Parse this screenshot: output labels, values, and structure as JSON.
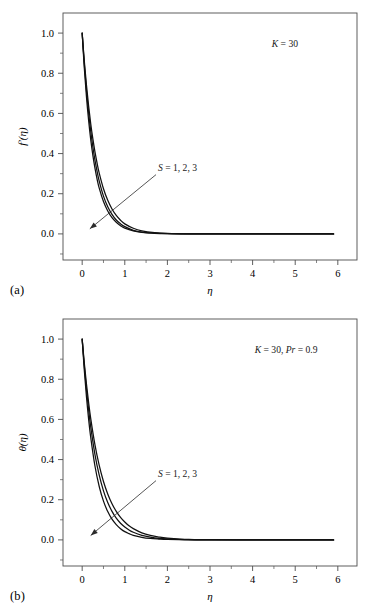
{
  "figure": {
    "background": "#ffffff",
    "curve_color": "#111111",
    "axis_color": "#4d4d4d"
  },
  "panels": [
    {
      "id": "a",
      "label": "(a)",
      "annotation": "K = 30",
      "annotation_parts": {
        "symbol": "K",
        "rest": " = 30"
      },
      "curve_label": "S = 1, 2, 3",
      "curve_label_parts": {
        "symbol": "S",
        "rest": " = 1, 2, 3"
      },
      "chart_data": {
        "type": "line",
        "title": "",
        "xlabel": "η",
        "ylabel": "f′(η)",
        "xlim": [
          -0.45,
          6.45
        ],
        "ylim": [
          -0.13,
          1.1
        ],
        "xticks": [
          0,
          1,
          2,
          3,
          4,
          5,
          6
        ],
        "xticklabels": [
          "0",
          "1",
          "2",
          "3",
          "4",
          "5",
          "6"
        ],
        "xminor_step": 0.5,
        "yticks": [
          0.0,
          0.2,
          0.4,
          0.6,
          0.8,
          1.0
        ],
        "yticklabels": [
          "0.0",
          "0.2",
          "0.4",
          "0.6",
          "0.8",
          "1.0"
        ],
        "yminor_step": 0.1,
        "grid": false,
        "legend": "none",
        "annotations": [
          {
            "text": "K = 30",
            "x": 4.45,
            "y": 0.93
          },
          {
            "text": "S = 1, 2, 3",
            "x": 1.78,
            "y": 0.315,
            "arrow_to": {
              "x": 0.18,
              "y": 0.025
            }
          }
        ],
        "series": [
          {
            "name": "S = 1",
            "x": [
              0,
              0.05,
              0.1,
              0.15,
              0.2,
              0.25,
              0.3,
              0.35,
              0.4,
              0.5,
              0.6,
              0.7,
              0.8,
              0.9,
              1.0,
              1.2,
              1.4,
              1.7,
              2.0,
              2.5,
              3.0,
              4.0,
              5.0,
              5.9
            ],
            "y": [
              1.0,
              0.826,
              0.684,
              0.567,
              0.471,
              0.392,
              0.327,
              0.273,
              0.228,
              0.161,
              0.114,
              0.081,
              0.058,
              0.041,
              0.029,
              0.015,
              0.008,
              0.003,
              0.001,
              0.0,
              0.0,
              0.0,
              0.0,
              0.0
            ]
          },
          {
            "name": "S = 2",
            "x": [
              0,
              0.05,
              0.1,
              0.15,
              0.2,
              0.25,
              0.3,
              0.35,
              0.4,
              0.5,
              0.6,
              0.7,
              0.8,
              0.9,
              1.0,
              1.2,
              1.4,
              1.7,
              2.0,
              2.5,
              3.0,
              4.0,
              5.0,
              5.9
            ],
            "y": [
              1.0,
              0.846,
              0.716,
              0.606,
              0.513,
              0.434,
              0.367,
              0.311,
              0.263,
              0.188,
              0.135,
              0.097,
              0.069,
              0.05,
              0.036,
              0.018,
              0.009,
              0.004,
              0.001,
              0.0,
              0.0,
              0.0,
              0.0,
              0.0
            ]
          },
          {
            "name": "S = 3",
            "x": [
              0,
              0.05,
              0.1,
              0.15,
              0.2,
              0.25,
              0.3,
              0.35,
              0.4,
              0.5,
              0.6,
              0.7,
              0.8,
              0.9,
              1.0,
              1.2,
              1.4,
              1.7,
              2.0,
              2.5,
              3.0,
              4.0,
              5.0,
              5.9
            ],
            "y": [
              1.0,
              0.861,
              0.742,
              0.639,
              0.55,
              0.474,
              0.408,
              0.352,
              0.303,
              0.225,
              0.167,
              0.124,
              0.092,
              0.068,
              0.05,
              0.028,
              0.015,
              0.006,
              0.002,
              0.0,
              0.0,
              0.0,
              0.0,
              0.0
            ]
          }
        ]
      }
    },
    {
      "id": "b",
      "label": "(b)",
      "annotation": "K = 30, Pr = 0.9",
      "annotation_parts": {
        "symbol": "K",
        "mid": " = 30, ",
        "symbol2": "Pr",
        "rest": " = 0.9"
      },
      "curve_label": "S = 1, 2, 3",
      "curve_label_parts": {
        "symbol": "S",
        "rest": " = 1, 2, 3"
      },
      "chart_data": {
        "type": "line",
        "title": "",
        "xlabel": "η",
        "ylabel": "θ(η)",
        "xlim": [
          -0.45,
          6.45
        ],
        "ylim": [
          -0.13,
          1.1
        ],
        "xticks": [
          0,
          1,
          2,
          3,
          4,
          5,
          6
        ],
        "xticklabels": [
          "0",
          "1",
          "2",
          "3",
          "4",
          "5",
          "6"
        ],
        "xminor_step": 0.5,
        "yticks": [
          0.0,
          0.2,
          0.4,
          0.6,
          0.8,
          1.0
        ],
        "yticklabels": [
          "0.0",
          "0.2",
          "0.4",
          "0.6",
          "0.8",
          "1.0"
        ],
        "yminor_step": 0.1,
        "grid": false,
        "legend": "none",
        "annotations": [
          {
            "text": "K = 30, Pr = 0.9",
            "x": 4.05,
            "y": 0.93
          },
          {
            "text": "S = 1, 2, 3",
            "x": 1.78,
            "y": 0.315,
            "arrow_to": {
              "x": 0.2,
              "y": 0.022
            }
          }
        ],
        "series": [
          {
            "name": "S = 1",
            "x": [
              0,
              0.05,
              0.1,
              0.15,
              0.2,
              0.3,
              0.4,
              0.5,
              0.6,
              0.7,
              0.8,
              0.9,
              1.0,
              1.1,
              1.2,
              1.4,
              1.6,
              1.8,
              2.0,
              2.5,
              3.0,
              4.0,
              5.0,
              5.9
            ],
            "y": [
              1.0,
              0.845,
              0.714,
              0.604,
              0.512,
              0.368,
              0.266,
              0.193,
              0.141,
              0.103,
              0.076,
              0.056,
              0.041,
              0.031,
              0.023,
              0.013,
              0.007,
              0.004,
              0.002,
              0.0,
              0.0,
              0.0,
              0.0,
              0.0
            ]
          },
          {
            "name": "S = 2",
            "x": [
              0,
              0.05,
              0.1,
              0.15,
              0.2,
              0.3,
              0.4,
              0.5,
              0.6,
              0.7,
              0.8,
              0.9,
              1.0,
              1.1,
              1.2,
              1.4,
              1.6,
              1.8,
              2.0,
              2.5,
              3.0,
              4.0,
              5.0,
              5.9
            ],
            "y": [
              1.0,
              0.866,
              0.75,
              0.65,
              0.564,
              0.425,
              0.322,
              0.244,
              0.186,
              0.142,
              0.108,
              0.083,
              0.064,
              0.049,
              0.038,
              0.023,
              0.014,
              0.008,
              0.005,
              0.001,
              0.0,
              0.0,
              0.0,
              0.0
            ]
          },
          {
            "name": "S = 3",
            "x": [
              0,
              0.05,
              0.1,
              0.15,
              0.2,
              0.3,
              0.4,
              0.5,
              0.6,
              0.7,
              0.8,
              0.9,
              1.0,
              1.1,
              1.2,
              1.4,
              1.6,
              1.8,
              2.0,
              2.5,
              3.0,
              4.0,
              5.0,
              5.9
            ],
            "y": [
              1.0,
              0.881,
              0.777,
              0.686,
              0.605,
              0.473,
              0.371,
              0.291,
              0.229,
              0.18,
              0.142,
              0.112,
              0.089,
              0.07,
              0.056,
              0.035,
              0.022,
              0.014,
              0.009,
              0.002,
              0.001,
              0.0,
              0.0,
              0.0
            ]
          }
        ]
      }
    }
  ]
}
